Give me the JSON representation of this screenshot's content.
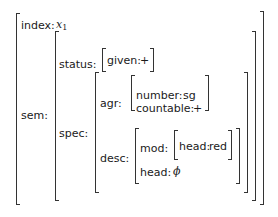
{
  "avm": {
    "index": {
      "label": "index:",
      "value_var": "x",
      "value_sub": "1"
    },
    "sem": {
      "label": "sem:",
      "status": {
        "label": "status:",
        "given_label": "given:",
        "given_value": "+"
      },
      "spec": {
        "label": "spec:",
        "agr": {
          "label": "agr:",
          "number_label": "number:",
          "number_value": "sg",
          "countable_label": "countable:",
          "countable_value": "+"
        },
        "desc": {
          "label": "desc:",
          "mod_label": "mod:",
          "mod_head_label": "head:",
          "mod_head_value": "red",
          "head_label": "head:",
          "head_value": "ϕ"
        }
      }
    }
  }
}
